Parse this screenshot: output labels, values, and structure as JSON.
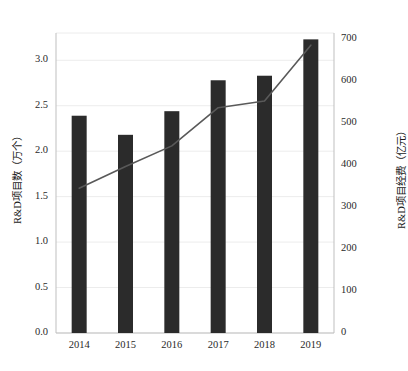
{
  "chart_data": {
    "type": "bar",
    "title": "",
    "subtitle": "",
    "categories": [
      "2014",
      "2015",
      "2016",
      "2017",
      "2018",
      "2019"
    ],
    "xlabel": "",
    "grid": true,
    "legend": "none",
    "series": [
      {
        "name": "R&D项目数",
        "type": "bar",
        "axis": "left",
        "unit": "万个",
        "color": "#2b2b2b",
        "values": [
          2.39,
          2.18,
          2.44,
          2.78,
          2.83,
          3.23
        ]
      },
      {
        "name": "R&D项目经费",
        "type": "line",
        "axis": "right",
        "unit": "亿元",
        "color": "#595959",
        "values": [
          345,
          397,
          446,
          537,
          553,
          686
        ]
      }
    ],
    "left_axis": {
      "label": "R&D项目数（万个）",
      "ticks": [
        "0.0",
        "0.5",
        "1.0",
        "1.5",
        "2.0",
        "2.5",
        "3.0"
      ],
      "tick_values": [
        0.0,
        0.5,
        1.0,
        1.5,
        2.0,
        2.5,
        3.0
      ],
      "ylim": [
        0.0,
        3.3
      ]
    },
    "right_axis": {
      "label": "R&D项目经费（亿元）",
      "ticks": [
        "0",
        "100",
        "200",
        "300",
        "400",
        "500",
        "600",
        "700"
      ],
      "tick_values": [
        0,
        100,
        200,
        300,
        400,
        500,
        600,
        700
      ],
      "ylim": [
        0,
        715
      ]
    },
    "colors": {
      "bar": "#2b2b2b",
      "line": "#595959",
      "grid": "#ececec",
      "axis": "#bfbfbf",
      "text": "#1a1a1a",
      "background": "#ffffff"
    }
  }
}
